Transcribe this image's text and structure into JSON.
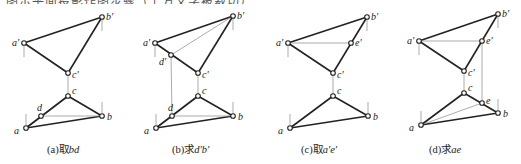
{
  "top_text": "图示平面投影作图步骤（上方文字被裁切）",
  "panels": [
    {
      "id": "a",
      "caption_prefix": "(a)取",
      "caption_var": "bd",
      "points_v": {
        "a'": [
          24,
          43
        ],
        "b'": [
          102,
          17
        ],
        "c'": [
          68,
          73
        ]
      },
      "points_h": {
        "a": [
          26,
          128
        ],
        "b": [
          102,
          116
        ],
        "c": [
          68,
          96
        ],
        "d": [
          41,
          116
        ]
      },
      "labels": {
        "a'": "a'",
        "b'": "b'",
        "c'": "c'",
        "a": "a",
        "b": "b",
        "c": "c",
        "d": "d"
      }
    },
    {
      "id": "b",
      "caption_prefix": "(b)求",
      "caption_var": "d'b'",
      "points_v": {
        "a'": [
          155,
          43
        ],
        "b'": [
          233,
          16
        ],
        "c'": [
          198,
          73
        ],
        "d'": [
          171,
          55
        ]
      },
      "points_h": {
        "a": [
          156,
          128
        ],
        "b": [
          233,
          116
        ],
        "c": [
          198,
          96
        ],
        "d": [
          172,
          116
        ]
      },
      "labels": {
        "a'": "a'",
        "b'": "b'",
        "c'": "c'",
        "d'": "d'",
        "a": "a",
        "b": "b",
        "c": "c",
        "d": "d"
      }
    },
    {
      "id": "c",
      "caption_prefix": "(c)取",
      "caption_var": "a'e'",
      "points_v": {
        "a'": [
          288,
          43
        ],
        "b'": [
          367,
          17
        ],
        "c'": [
          333,
          73
        ],
        "e'": [
          351,
          43
        ]
      },
      "points_h": {
        "a": [
          290,
          128
        ],
        "b": [
          368,
          116
        ],
        "c": [
          333,
          96
        ]
      },
      "labels": {
        "a'": "a'",
        "b'": "b'",
        "c'": "c'",
        "e'": "e'",
        "a": "a",
        "b": "b",
        "c": "c"
      }
    },
    {
      "id": "d",
      "caption_prefix": "(d)求",
      "caption_var": "ae",
      "points_v": {
        "a'": [
          419,
          41
        ],
        "b'": [
          498,
          14
        ],
        "c'": [
          464,
          71
        ],
        "e'": [
          482,
          41
        ]
      },
      "points_h": {
        "a": [
          421,
          125
        ],
        "b": [
          498,
          113
        ],
        "c": [
          464,
          93
        ],
        "e": [
          482,
          103
        ]
      },
      "labels": {
        "a'": "a'",
        "b'": "b'",
        "c'": "c'",
        "e'": "e'",
        "a": "a",
        "b": "b",
        "c": "c",
        "e": "e"
      }
    }
  ],
  "colors": {
    "line": "#222222",
    "thin": "#888888",
    "point_fill": "#ffffff"
  }
}
